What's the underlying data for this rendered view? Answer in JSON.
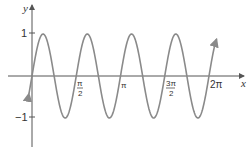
{
  "chart_data": {
    "type": "line",
    "title": "",
    "xlabel": "x",
    "ylabel": "y",
    "function": "y = sin(4x)",
    "x_ticks": [
      "π/2",
      "π",
      "3π/2",
      "2π"
    ],
    "x_tick_values": [
      1.5708,
      3.1416,
      4.7124,
      6.2832
    ],
    "y_ticks": [
      "1",
      "−1"
    ],
    "y_tick_values": [
      1,
      -1
    ],
    "xlim": [
      -0.1,
      6.45
    ],
    "ylim": [
      -1.3,
      1.45
    ],
    "grid": false,
    "legend": null,
    "series": [
      {
        "name": "y = sin(4x)",
        "amplitude": 1,
        "period": 1.5708,
        "x": [
          0,
          0.3927,
          0.7854,
          1.1781,
          1.5708,
          1.9635,
          2.3562,
          2.7489,
          3.1416,
          3.5343,
          3.927,
          4.3197,
          4.7124,
          5.1051,
          5.4978,
          5.8905,
          6.2832
        ],
        "values": [
          0,
          1,
          0,
          -1,
          0,
          1,
          0,
          -1,
          0,
          1,
          0,
          -1,
          0,
          1,
          0,
          -1,
          0
        ]
      }
    ]
  },
  "labels": {
    "y_axis": "y",
    "x_axis": "x",
    "tick_one": "1",
    "tick_neg_one": "−1",
    "pi_half_num": "π",
    "pi_half_den": "2",
    "pi": "π",
    "three_pi_half_num": "3π",
    "three_pi_half_den": "2",
    "two_pi": "2π"
  },
  "colors": {
    "curve": "#8a8a8a",
    "axes": "#555555"
  }
}
